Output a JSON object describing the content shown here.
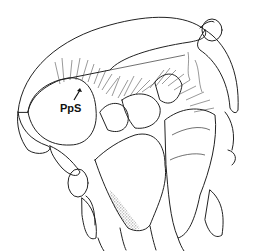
{
  "figure": {
    "type": "anatomical stippled line illustration",
    "labels": [
      {
        "id": "pps",
        "text": "PpS",
        "x": 70,
        "y": 107,
        "arrow": true
      }
    ],
    "colors": {
      "ink": "#222222",
      "background": "#ffffff"
    }
  }
}
